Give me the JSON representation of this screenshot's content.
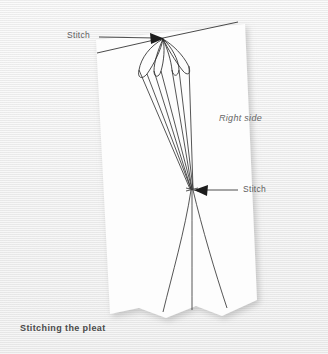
{
  "figure": {
    "title": "Stitching the pleat",
    "background_color": "#efefef",
    "fabric_color": "#fcfcfc",
    "ink_color": "#2b2b2b",
    "label_color": "#5d5d5d"
  },
  "caption": {
    "text": "Stitching the pleat"
  },
  "labels": {
    "stitch_top": "Stitch",
    "stitch_middle": "Stitch",
    "right_side": "Right side"
  },
  "annotations": [
    {
      "name": "stitch-top",
      "text": "Stitch",
      "arrow_direction": "right",
      "target_x": 163,
      "target_y": 38
    },
    {
      "name": "stitch-middle",
      "text": "Stitch",
      "arrow_direction": "left",
      "target_x": 192,
      "target_y": 190
    },
    {
      "name": "right-side",
      "text": "Right side",
      "arrow_direction": "none",
      "target_x": 240,
      "target_y": 120
    }
  ]
}
